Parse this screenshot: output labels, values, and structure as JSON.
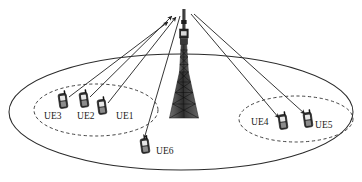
{
  "diagram": {
    "type": "network-topology",
    "canvas": {
      "width": 362,
      "height": 182
    },
    "colors": {
      "background": "#ffffff",
      "line": "#2b2b2b",
      "cell_boundary": "#2b2b2b",
      "group_boundary": "#3a3a3a",
      "device_body": "#2e2e2e",
      "device_outline": "#111111",
      "tower": "#4a4a4a",
      "label_text": "#1a1a1a"
    },
    "cell": {
      "name": "cell-coverage-ellipse",
      "style": "solid",
      "cx": 181,
      "cy": 112,
      "rx": 172,
      "ry": 58
    },
    "groups": [
      {
        "id": "group-left",
        "name": "ue-group-left",
        "style": "dashed",
        "cx": 96,
        "cy": 110,
        "rx": 62,
        "ry": 26,
        "members": [
          "UE3",
          "UE2",
          "UE1"
        ]
      },
      {
        "id": "group-right",
        "name": "ue-group-right",
        "style": "dashed",
        "cx": 296,
        "cy": 119,
        "rx": 57,
        "ry": 23,
        "members": [
          "UE4",
          "UE5"
        ]
      }
    ],
    "tower": {
      "name": "base-station-tower",
      "label": "",
      "top_x": 184,
      "top_y": 10,
      "base_y": 118,
      "base_half_width": 14,
      "mast_half_width": 3
    },
    "devices": [
      {
        "id": "UE1",
        "label": "UE1",
        "name": "ue-device-ue1",
        "x": 102,
        "y": 107,
        "label_x": 116,
        "label_y": 119,
        "label_anchor": "start",
        "group": "group-left",
        "link": "uplink"
      },
      {
        "id": "UE2",
        "label": "UE2",
        "name": "ue-device-ue2",
        "x": 84,
        "y": 100,
        "label_x": 77,
        "label_y": 119,
        "label_anchor": "start",
        "group": "group-left",
        "link": "uplink"
      },
      {
        "id": "UE3",
        "label": "UE3",
        "name": "ue-device-ue3",
        "x": 63,
        "y": 101,
        "label_x": 44,
        "label_y": 119,
        "label_anchor": "start",
        "group": "group-left",
        "link": "uplink"
      },
      {
        "id": "UE4",
        "label": "UE4",
        "name": "ue-device-ue4",
        "x": 283,
        "y": 122,
        "label_x": 251,
        "label_y": 125,
        "label_anchor": "start",
        "group": "group-right",
        "link": "downlink"
      },
      {
        "id": "UE5",
        "label": "UE5",
        "name": "ue-device-ue5",
        "x": 308,
        "y": 120,
        "label_x": 315,
        "label_y": 128,
        "label_anchor": "start",
        "group": "group-right",
        "link": "downlink"
      },
      {
        "id": "UE6",
        "label": "UE6",
        "name": "ue-device-ue6",
        "x": 145,
        "y": 146,
        "label_x": 156,
        "label_y": 154,
        "label_anchor": "start",
        "group": null,
        "link": "downlink"
      }
    ],
    "links": [
      {
        "id": "link-ue1",
        "name": "uplink-arrow-ue1",
        "from": "UE1",
        "to": "tower",
        "direction": "uplink",
        "x1": 108,
        "y1": 103,
        "x2": 176,
        "y2": 17
      },
      {
        "id": "link-ue2",
        "name": "uplink-arrow-ue2",
        "from": "UE2",
        "to": "tower",
        "direction": "uplink",
        "x1": 90,
        "y1": 97,
        "x2": 172,
        "y2": 16
      },
      {
        "id": "link-ue3",
        "name": "uplink-arrow-ue3",
        "from": "UE3",
        "to": "tower",
        "direction": "uplink",
        "x1": 69,
        "y1": 97,
        "x2": 168,
        "y2": 22
      },
      {
        "id": "link-ue4",
        "name": "downlink-arrow-ue4",
        "from": "tower",
        "to": "UE4",
        "direction": "downlink",
        "x1": 191,
        "y1": 14,
        "x2": 279,
        "y2": 118
      },
      {
        "id": "link-ue5",
        "name": "downlink-arrow-ue5",
        "from": "tower",
        "to": "UE5",
        "direction": "downlink",
        "x1": 194,
        "y1": 14,
        "x2": 305,
        "y2": 114
      },
      {
        "id": "link-ue6",
        "name": "downlink-arrow-ue6",
        "from": "tower",
        "to": "UE6",
        "direction": "downlink",
        "x1": 180,
        "y1": 16,
        "x2": 144,
        "y2": 139
      }
    ]
  }
}
